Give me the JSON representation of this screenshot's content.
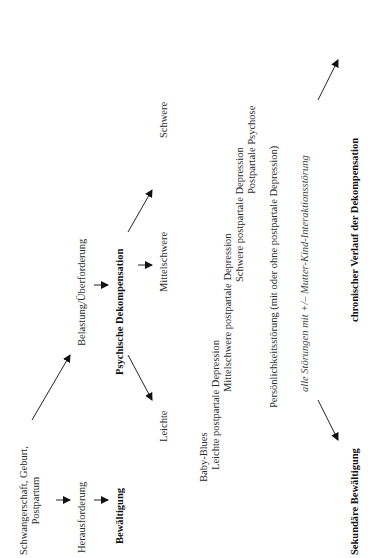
{
  "diagram": {
    "orientation": "rotated -90 degrees",
    "nodes": {
      "start_line1": "Schwangerschaft, Geburt,",
      "start_line2": "Postpartum",
      "challenge": "Herausforderung",
      "coping": "Bewältigung",
      "burden": "Belastung/Überforderung",
      "decompensation": "Psychische Dekompensation",
      "mild": "Leichte",
      "moderate": "Mittelschwere",
      "severe": "Schwere",
      "baby_blues": "Baby-Blues",
      "mild_ppd": "Leichte postpartale Depression",
      "moderate_ppd": "Mittelschwere postpartale Depression",
      "severe_ppd": "Schwere postpartale Depression",
      "pp_psychosis": "Postpartale Psychose",
      "personality_disorder": "Persönlichkeitsstörung (mit oder ohne postpartale Depression)",
      "all_disorders": "alle Störungen mit +/– Mutter-Kind-Interaktionsstörung",
      "secondary_coping": "Sekundäre Bewältigung",
      "chronic_course": "chronischer Verlauf der Dekompensation"
    },
    "edges": [
      [
        "start",
        "challenge"
      ],
      [
        "challenge",
        "coping"
      ],
      [
        "start",
        "burden"
      ],
      [
        "burden",
        "decompensation"
      ],
      [
        "decompensation",
        "mild"
      ],
      [
        "decompensation",
        "moderate"
      ],
      [
        "decompensation",
        "severe"
      ],
      [
        "all_disorders",
        "secondary_coping"
      ],
      [
        "all_disorders",
        "chronic_course"
      ]
    ]
  }
}
